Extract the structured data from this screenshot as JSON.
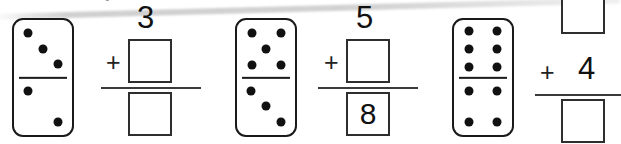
{
  "worksheet": {
    "title": "Domino addition fact worksheet",
    "artifact_note": "scan streak"
  },
  "clipped_text_remnants": [
    {
      "glyph": "°",
      "x": 104,
      "y": -4
    },
    {
      "glyph": "'",
      "x": 352,
      "y": -4
    }
  ],
  "problems": [
    {
      "id": "problem-1",
      "domino": {
        "top_pips": 3,
        "bottom_pips": 2,
        "top_layout": "diagonal-3",
        "bottom_layout": "diagonal-2"
      },
      "equation": {
        "addend_top": "3",
        "addend_top_filled": true,
        "operator": "+",
        "addend_box": "",
        "addend_box_filled": false,
        "sum_box": "",
        "sum_box_filled": false,
        "style": "number-above-box"
      }
    },
    {
      "id": "problem-2",
      "domino": {
        "top_pips": 5,
        "bottom_pips": 3,
        "top_layout": "quincunx-5",
        "bottom_layout": "diagonal-3"
      },
      "equation": {
        "addend_top": "5",
        "addend_top_filled": true,
        "operator": "+",
        "addend_box": "",
        "addend_box_filled": false,
        "sum_box": "8",
        "sum_box_filled": true,
        "style": "number-above-box"
      }
    },
    {
      "id": "problem-3",
      "domino": {
        "top_pips": 6,
        "bottom_pips": 4,
        "top_layout": "two-columns-6",
        "bottom_layout": "corners-4"
      },
      "equation": {
        "addend_box": "",
        "addend_box_filled": false,
        "operator": "+",
        "addend_inline": "4",
        "addend_inline_filled": true,
        "sum_box": "",
        "sum_box_filled": false,
        "style": "box-above-inline-number"
      }
    }
  ],
  "colors": {
    "ink": "#111111",
    "box_border": "#2e2e2e",
    "domino_border": "#1a1a1a",
    "paper": "#ffffff",
    "streak": "#c8c8c8"
  }
}
